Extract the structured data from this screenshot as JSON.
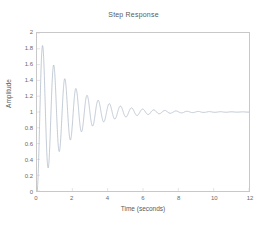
{
  "chart_data": {
    "type": "line",
    "title": "Step Response",
    "xlabel": "Time (seconds)",
    "ylabel": "Amplitude",
    "xlim": [
      0,
      12
    ],
    "ylim": [
      0,
      2
    ],
    "xticks": [
      0,
      2,
      4,
      6,
      8,
      10,
      12
    ],
    "xtick_labels": [
      "0",
      "2",
      "4",
      "6",
      "8",
      "10",
      "12"
    ],
    "yticks": [
      0,
      0.2,
      0.4,
      0.6,
      0.8,
      1,
      1.2,
      1.4,
      1.6,
      1.8,
      2
    ],
    "ytick_labels": [
      "0",
      "0.2",
      "0.4",
      "0.6",
      "0.8",
      "1",
      "1.2",
      "1.4",
      "1.6",
      "1.8",
      "2"
    ],
    "grid": false,
    "legend": null,
    "line_color": "#9aa7b8",
    "line_width": 0.6,
    "system": {
      "description": "lightly damped second-order step response",
      "steady_state": 1,
      "damping_ratio": 0.055,
      "natural_frequency_rad_s": 10.0,
      "damped_period_s": 0.63,
      "first_peak_value": 1.84,
      "first_peak_time_s": 0.35,
      "first_trough_value": 0.27,
      "first_trough_time_s": 0.66
    },
    "peaks": [
      {
        "t": 0.35,
        "y": 1.84
      },
      {
        "t": 0.98,
        "y": 1.62
      },
      {
        "t": 1.61,
        "y": 1.44
      },
      {
        "t": 2.24,
        "y": 1.31
      },
      {
        "t": 2.86,
        "y": 1.22
      },
      {
        "t": 3.49,
        "y": 1.155
      },
      {
        "t": 4.12,
        "y": 1.11
      },
      {
        "t": 4.75,
        "y": 1.078
      },
      {
        "t": 5.38,
        "y": 1.055
      },
      {
        "t": 6.01,
        "y": 1.039
      },
      {
        "t": 6.64,
        "y": 1.027
      },
      {
        "t": 7.27,
        "y": 1.019
      },
      {
        "t": 7.89,
        "y": 1.014
      },
      {
        "t": 8.52,
        "y": 1.01
      },
      {
        "t": 9.15,
        "y": 1.007
      },
      {
        "t": 9.78,
        "y": 1.005
      },
      {
        "t": 10.41,
        "y": 1.003
      },
      {
        "t": 11.04,
        "y": 1.002
      },
      {
        "t": 11.67,
        "y": 1.002
      }
    ],
    "troughs": [
      {
        "t": 0.66,
        "y": 0.27
      },
      {
        "t": 1.29,
        "y": 0.465
      },
      {
        "t": 1.92,
        "y": 0.61
      },
      {
        "t": 2.55,
        "y": 0.72
      },
      {
        "t": 3.18,
        "y": 0.8
      },
      {
        "t": 3.8,
        "y": 0.855
      },
      {
        "t": 4.43,
        "y": 0.895
      },
      {
        "t": 5.06,
        "y": 0.925
      },
      {
        "t": 5.69,
        "y": 0.947
      },
      {
        "t": 6.32,
        "y": 0.962
      },
      {
        "t": 6.95,
        "y": 0.973
      },
      {
        "t": 7.58,
        "y": 0.981
      },
      {
        "t": 8.21,
        "y": 0.986
      },
      {
        "t": 8.84,
        "y": 0.99
      },
      {
        "t": 9.47,
        "y": 0.993
      },
      {
        "t": 10.1,
        "y": 0.995
      },
      {
        "t": 10.72,
        "y": 0.997
      },
      {
        "t": 11.35,
        "y": 0.998
      }
    ]
  }
}
